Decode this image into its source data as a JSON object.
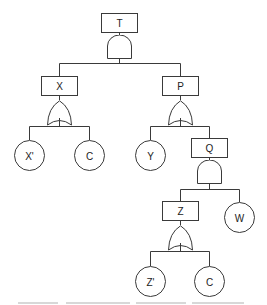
{
  "diagram": {
    "type": "fault-tree",
    "nodes": {
      "T": {
        "label": "T",
        "kind": "event",
        "gate": "AND"
      },
      "X": {
        "label": "X",
        "kind": "event",
        "gate": "OR"
      },
      "P": {
        "label": "P",
        "kind": "event",
        "gate": "OR"
      },
      "Q": {
        "label": "Q",
        "kind": "event",
        "gate": "AND"
      },
      "Z": {
        "label": "Z",
        "kind": "event",
        "gate": "OR"
      },
      "Xp": {
        "label": "X'",
        "kind": "basic"
      },
      "C1": {
        "label": "C",
        "kind": "basic"
      },
      "Y": {
        "label": "Y",
        "kind": "basic"
      },
      "W": {
        "label": "W",
        "kind": "basic"
      },
      "Zp": {
        "label": "Z'",
        "kind": "basic"
      },
      "C2": {
        "label": "C",
        "kind": "basic"
      }
    },
    "edges": [
      [
        "T",
        "X"
      ],
      [
        "T",
        "P"
      ],
      [
        "X",
        "Xp"
      ],
      [
        "X",
        "C1"
      ],
      [
        "P",
        "Y"
      ],
      [
        "P",
        "Q"
      ],
      [
        "Q",
        "Z"
      ],
      [
        "Q",
        "W"
      ],
      [
        "Z",
        "Zp"
      ],
      [
        "Z",
        "C2"
      ]
    ],
    "colors": {
      "stroke": "#3a3a3a",
      "text": "#222222",
      "background": "#ffffff"
    }
  }
}
